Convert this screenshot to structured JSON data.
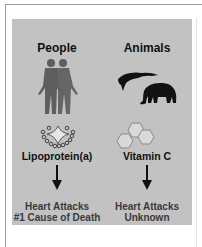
{
  "columns": [
    {
      "heading": "People",
      "icon": "human-figures-icon",
      "molecule_icon": "lipoprotein-molecule-icon",
      "substance": "Lipoprotein(a)",
      "outcome_line1": "Heart Attacks",
      "outcome_line2": "#1 Cause of Death"
    },
    {
      "heading": "Animals",
      "icon": "shark-and-elephant-icon",
      "molecule_icon": "vitamin-c-hexagon-icon",
      "substance": "Vitamin C",
      "outcome_line1": "Heart Attacks",
      "outcome_line2": "Unknown"
    }
  ],
  "colors": {
    "panel": "#c2c2c2",
    "figures": "#5e5e5e",
    "animals": "#111111",
    "text": "#111111",
    "outcome_text": "#3a3a3a"
  }
}
